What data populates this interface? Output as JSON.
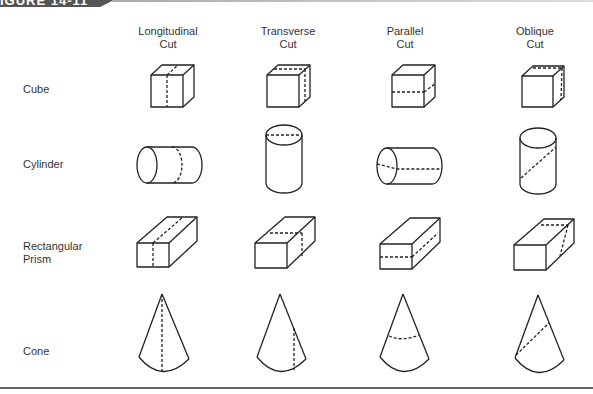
{
  "figure": {
    "label": "IGURE 14-11"
  },
  "columns": [
    {
      "line1": "Longitudinal",
      "line2": "Cut"
    },
    {
      "line1": "Transverse",
      "line2": "Cut"
    },
    {
      "line1": "Parallel",
      "line2": "Cut"
    },
    {
      "line1": "Oblique",
      "line2": "Cut"
    }
  ],
  "rows": [
    {
      "line1": "Cube",
      "line2": ""
    },
    {
      "line1": "Cylinder",
      "line2": ""
    },
    {
      "line1": "Rectangular",
      "line2": "Prism"
    },
    {
      "line1": "Cone",
      "line2": ""
    }
  ],
  "colors": {
    "stroke": "#222222",
    "tab": "#555555",
    "rule": "#666666"
  }
}
